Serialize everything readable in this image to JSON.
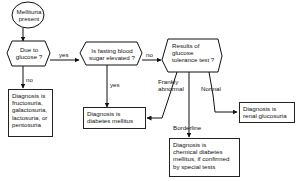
{
  "flowchart": {
    "start": {
      "lines": [
        "Mellituria",
        "present"
      ]
    },
    "decisions": [
      {
        "id": "due-to-glucose",
        "lines": [
          "Due to",
          "glucose ?"
        ]
      },
      {
        "id": "fasting-blood-sugar",
        "lines": [
          "Is fasting blood",
          "sugar elevated ?"
        ]
      },
      {
        "id": "glucose-tolerance",
        "lines": [
          "Results of",
          "glucose",
          "tolerance test ?"
        ]
      }
    ],
    "outcomes": [
      {
        "id": "fructosuria",
        "lines": [
          "Diagnosis is",
          "fructosuria,",
          "galactosuria,",
          "lactosuria, or",
          "pentosuria"
        ]
      },
      {
        "id": "diabetes-mellitus",
        "lines": [
          "Diagnosis is",
          "diabetes mellitus"
        ]
      },
      {
        "id": "renal-glucosuria",
        "lines": [
          "Diagnosis is",
          "renal glucosuria"
        ]
      },
      {
        "id": "chemical-diabetes",
        "lines": [
          "Diagnosis is",
          "chemical diabetes",
          "mellitus, if confirmed",
          "by special tests"
        ]
      }
    ],
    "edge_labels": {
      "yes1": "yes",
      "no1": "no",
      "yes2": "yes",
      "no2": "no",
      "frankly_abnormal": [
        "Frankly",
        "abnormal"
      ],
      "normal": "Normal",
      "borderline": "Borderline"
    }
  }
}
